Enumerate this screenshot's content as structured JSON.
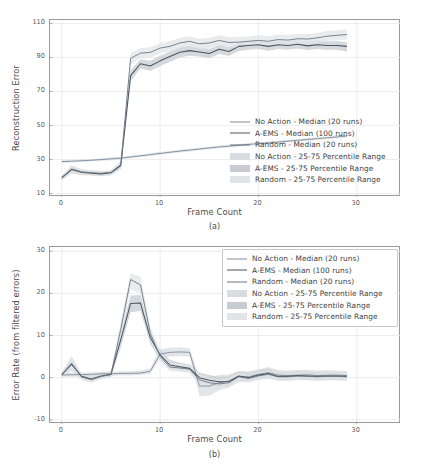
{
  "figure": {
    "width": 429,
    "height": 475,
    "background": "#ffffff"
  },
  "subfigures": [
    {
      "caption": "(a)"
    },
    {
      "caption": "(b)"
    }
  ],
  "series_styles": {
    "no_action_line": "#7f8c9b",
    "aems_line": "#4a5560",
    "random_line": "#6b7682",
    "no_action_band": "#d9dde1",
    "aems_band": "#c6ccd2",
    "random_band": "#e2e5e8",
    "grid": "#e8e8ec",
    "frame": "#9a9a9a",
    "text": "#3f3f3f"
  },
  "chart_data": [
    {
      "type": "line",
      "panel": "(a)",
      "title": "",
      "xlabel": "Frame Count",
      "ylabel": "Reconstruction Error",
      "xlim": [
        -1.2,
        34.5
      ],
      "ylim": [
        8,
        112
      ],
      "xticks": [
        0,
        10,
        20,
        30
      ],
      "yticks": [
        10,
        30,
        50,
        70,
        90,
        110
      ],
      "grid": true,
      "legend_position": "center-right",
      "legend": [
        "No Action - Median (20 runs)",
        "A-EMS  - Median (100 runs)",
        "Random - Median (20 runs)",
        "No Action - 25-75 Percentile Range",
        "A-EMS  - 25-75 Percentile Range",
        "Random - 25-75 Percentile Range"
      ],
      "x": [
        0,
        1,
        2,
        3,
        4,
        5,
        6,
        7,
        8,
        9,
        10,
        11,
        12,
        13,
        14,
        15,
        16,
        17,
        18,
        19,
        20,
        21,
        22,
        23,
        24,
        25,
        26,
        27,
        28,
        29
      ],
      "series": [
        {
          "name": "No Action - Median (20 runs)",
          "key": "no_action",
          "values": [
            28.8,
            29.0,
            29.3,
            29.6,
            30.0,
            30.4,
            30.9,
            31.5,
            32.2,
            32.9,
            33.6,
            34.3,
            35.0,
            35.6,
            36.2,
            36.8,
            37.4,
            37.9,
            38.4,
            38.9,
            39.4,
            39.8,
            40.3,
            40.8,
            41.3,
            41.8,
            42.3,
            42.8,
            43.3,
            43.8
          ],
          "band_low": [
            28.0,
            28.2,
            28.5,
            28.8,
            29.2,
            29.6,
            30.1,
            30.7,
            31.4,
            32.1,
            32.8,
            33.5,
            34.2,
            34.8,
            35.4,
            36.0,
            36.6,
            37.1,
            37.6,
            38.1,
            38.6,
            39.0,
            39.5,
            40.0,
            40.5,
            41.0,
            41.5,
            42.0,
            42.5,
            43.0
          ],
          "band_high": [
            29.6,
            29.8,
            30.1,
            30.4,
            30.8,
            31.2,
            31.7,
            32.3,
            33.0,
            33.7,
            34.4,
            35.1,
            35.8,
            36.4,
            37.0,
            37.6,
            38.2,
            38.7,
            39.2,
            39.7,
            40.2,
            40.6,
            41.1,
            41.6,
            42.1,
            42.6,
            43.1,
            43.6,
            44.1,
            44.6
          ]
        },
        {
          "name": "A-EMS  - Median (100 runs)",
          "key": "aems",
          "values": [
            19.3,
            24.1,
            22.5,
            22.0,
            21.6,
            22.2,
            26.5,
            79.3,
            86.3,
            85.0,
            88.0,
            90.5,
            93.0,
            94.0,
            93.2,
            92.3,
            94.8,
            93.5,
            96.5,
            97.0,
            97.5,
            96.5,
            97.5,
            97.0,
            97.8,
            96.8,
            97.5,
            97.0,
            97.0,
            96.5
          ],
          "band_low": [
            18.0,
            22.0,
            21.0,
            20.6,
            20.2,
            20.8,
            24.5,
            76.0,
            83.5,
            82.0,
            85.0,
            87.5,
            90.0,
            91.0,
            90.5,
            89.5,
            92.0,
            90.8,
            93.8,
            94.5,
            95.0,
            94.0,
            95.0,
            94.5,
            95.3,
            94.3,
            95.0,
            94.5,
            94.5,
            93.5
          ],
          "band_high": [
            20.6,
            26.5,
            24.0,
            23.5,
            23.0,
            23.6,
            28.5,
            82.5,
            89.0,
            88.0,
            91.0,
            93.5,
            96.0,
            97.0,
            96.0,
            95.0,
            97.5,
            96.2,
            99.0,
            99.5,
            100.0,
            99.0,
            100.0,
            99.5,
            100.3,
            99.3,
            100.0,
            99.5,
            99.5,
            99.0
          ]
        },
        {
          "name": "Random - Median (20 runs)",
          "key": "random",
          "values": [
            19.3,
            24.5,
            22.8,
            22.3,
            21.9,
            22.5,
            27.0,
            89.5,
            92.5,
            93.0,
            95.5,
            96.5,
            98.5,
            99.5,
            98.0,
            98.5,
            100.0,
            98.8,
            99.0,
            99.5,
            100.0,
            99.5,
            100.5,
            100.2,
            101.0,
            100.8,
            101.5,
            102.5,
            103.0,
            103.5
          ],
          "band_low": [
            18.0,
            22.2,
            21.2,
            20.8,
            20.4,
            21.0,
            25.0,
            86.0,
            89.5,
            90.0,
            92.5,
            93.5,
            95.5,
            96.5,
            95.0,
            95.5,
            97.0,
            95.8,
            96.0,
            96.5,
            97.0,
            96.5,
            97.5,
            97.2,
            98.0,
            97.8,
            98.5,
            99.5,
            100.0,
            100.5
          ],
          "band_high": [
            20.6,
            26.8,
            24.4,
            23.8,
            23.4,
            24.0,
            29.0,
            92.5,
            95.5,
            96.0,
            98.5,
            99.5,
            101.5,
            102.5,
            101.0,
            101.5,
            103.0,
            101.8,
            102.0,
            102.5,
            103.0,
            102.5,
            103.5,
            103.2,
            104.0,
            103.8,
            104.5,
            105.5,
            106.0,
            106.5
          ]
        }
      ]
    },
    {
      "type": "line",
      "panel": "(b)",
      "title": "",
      "xlabel": "Frame Count",
      "ylabel": "Error Rate (from filtered errors)",
      "xlim": [
        -1.2,
        34.5
      ],
      "ylim": [
        -11,
        31
      ],
      "xticks": [
        0,
        10,
        20,
        30
      ],
      "yticks": [
        -10,
        0,
        10,
        20,
        30
      ],
      "grid": true,
      "legend_position": "upper-right",
      "legend": [
        "No Action - Median (20 runs)",
        "A-EMS  - Median (100 runs)",
        "Random - Median (20 runs)",
        "No Action - 25-75 Percentile Range",
        "A-EMS  - 25-75 Percentile Range",
        "Random - 25-75 Percentile Range"
      ],
      "x": [
        0,
        1,
        2,
        3,
        4,
        5,
        6,
        7,
        8,
        9,
        10,
        11,
        12,
        13,
        14,
        15,
        16,
        17,
        18,
        19,
        20,
        21,
        22,
        23,
        24,
        25,
        26,
        27,
        28,
        29
      ],
      "series": [
        {
          "name": "No Action - Median (20 runs)",
          "key": "no_action",
          "values": [
            0.6,
            0.7,
            0.7,
            0.8,
            0.9,
            0.9,
            1.0,
            1.0,
            1.1,
            1.5,
            5.6,
            6.0,
            6.1,
            6.0,
            -2.0,
            -2.0,
            -1.2,
            -0.8,
            0.3,
            0.2,
            0.8,
            1.2,
            0.6,
            0.5,
            0.6,
            0.7,
            0.5,
            0.6,
            0.6,
            0.5
          ],
          "band_low": [
            0.2,
            0.2,
            0.2,
            0.3,
            0.4,
            0.4,
            0.5,
            0.5,
            0.6,
            0.9,
            4.6,
            5.0,
            5.1,
            5.0,
            -4.5,
            -4.3,
            -3.0,
            -2.3,
            -1.0,
            -1.0,
            -0.4,
            -0.2,
            -0.6,
            -0.6,
            -0.5,
            -0.4,
            -0.6,
            -0.5,
            -0.5,
            -0.6
          ],
          "band_high": [
            1.1,
            1.2,
            1.2,
            1.3,
            1.4,
            1.4,
            1.5,
            1.6,
            1.7,
            2.2,
            6.8,
            7.1,
            7.2,
            7.0,
            0.0,
            0.2,
            0.6,
            0.8,
            1.6,
            1.5,
            2.0,
            2.5,
            1.8,
            1.7,
            1.8,
            1.9,
            1.7,
            1.8,
            1.7,
            1.6
          ]
        },
        {
          "name": "A-EMS  - Median (100 runs)",
          "key": "aems",
          "values": [
            0.7,
            3.2,
            0.3,
            -0.3,
            0.4,
            0.8,
            9.0,
            17.6,
            17.7,
            9.5,
            5.4,
            3.0,
            2.6,
            2.2,
            0.0,
            -0.6,
            -1.0,
            -0.9,
            0.4,
            0.0,
            0.6,
            1.0,
            0.3,
            0.3,
            0.5,
            0.4,
            0.3,
            0.4,
            0.4,
            0.3
          ],
          "band_low": [
            0.2,
            1.8,
            -0.4,
            -1.0,
            -0.2,
            0.2,
            7.2,
            15.5,
            15.8,
            8.0,
            4.2,
            2.0,
            1.7,
            1.3,
            -1.2,
            -1.8,
            -2.2,
            -2.0,
            -0.7,
            -1.0,
            -0.4,
            0.0,
            -0.6,
            -0.6,
            -0.4,
            -0.5,
            -0.6,
            -0.5,
            -0.5,
            -0.6
          ],
          "band_high": [
            1.3,
            4.8,
            1.0,
            0.4,
            1.1,
            1.5,
            10.8,
            19.5,
            19.6,
            11.0,
            6.6,
            4.2,
            3.6,
            3.2,
            1.2,
            0.6,
            0.2,
            0.3,
            1.5,
            1.1,
            1.7,
            2.1,
            1.3,
            1.3,
            1.5,
            1.4,
            1.3,
            1.4,
            1.3,
            1.2
          ]
        },
        {
          "name": "Random - Median (20 runs)",
          "key": "random",
          "values": [
            0.7,
            3.4,
            0.2,
            -0.5,
            0.3,
            0.7,
            11.5,
            23.3,
            22.0,
            10.5,
            5.0,
            2.5,
            2.3,
            2.0,
            -0.5,
            -1.2,
            -1.5,
            -1.2,
            0.2,
            -0.2,
            0.4,
            0.8,
            0.2,
            0.2,
            0.4,
            0.3,
            0.2,
            0.3,
            0.3,
            0.2
          ],
          "band_low": [
            0.1,
            1.6,
            -0.6,
            -1.3,
            -0.4,
            0.0,
            9.5,
            21.0,
            20.0,
            8.8,
            3.8,
            1.5,
            1.4,
            1.1,
            -1.8,
            -2.4,
            -2.7,
            -2.4,
            -0.9,
            -1.2,
            -0.6,
            -0.2,
            -0.8,
            -0.8,
            -0.6,
            -0.7,
            -0.8,
            -0.7,
            -0.7,
            -0.8
          ],
          "band_high": [
            1.3,
            5.2,
            1.0,
            0.3,
            1.0,
            1.4,
            13.5,
            24.8,
            24.0,
            12.2,
            6.2,
            3.6,
            3.3,
            3.0,
            0.8,
            0.0,
            -0.3,
            0.0,
            1.3,
            0.8,
            1.4,
            1.8,
            1.2,
            1.2,
            1.4,
            1.3,
            1.2,
            1.3,
            1.3,
            1.2
          ]
        }
      ]
    }
  ]
}
